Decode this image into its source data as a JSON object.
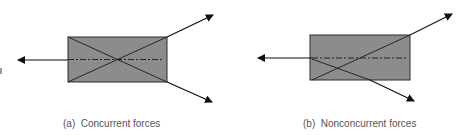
{
  "figures": [
    {
      "id": "a",
      "caption": "(a)  Concurrent forces",
      "description": "Rectangular body with three forces whose lines of action meet at a single point (center of body)"
    },
    {
      "id": "b",
      "caption": "(b)  Nonconcurrent forces",
      "description": "Rectangular body with three forces whose lines of action do not meet at a single point"
    }
  ],
  "colors": {
    "body_fill": "#8c8c8c",
    "line": "#1a1a1a",
    "caption": "#555555"
  }
}
